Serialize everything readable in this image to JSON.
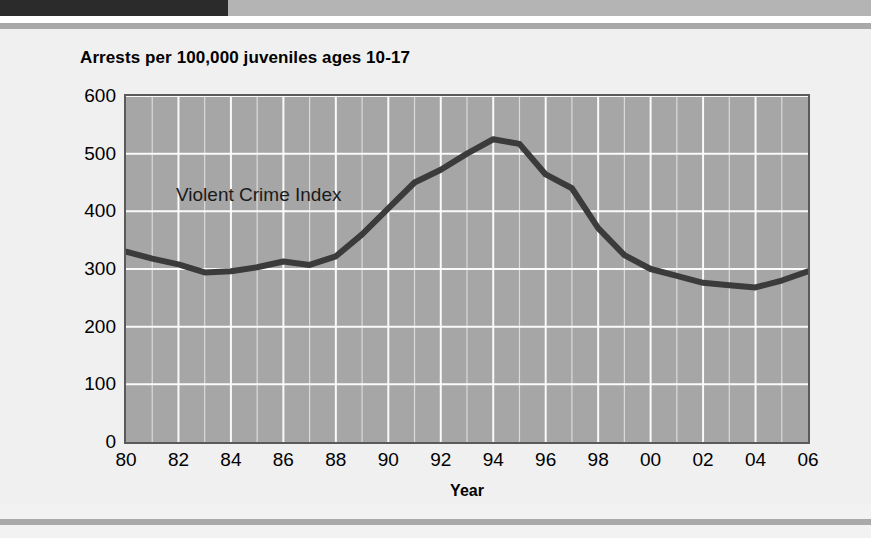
{
  "document": {
    "header_bar_dark_color": "#2b2b2b",
    "header_bar_gray_color": "#b4b4b4",
    "rule_color": "#a9a9a9",
    "panel_background": "#f0f0f0"
  },
  "chart_data": {
    "type": "line",
    "title": "Arrests per 100,000 juveniles ages 10-17",
    "subtitle": "",
    "xlabel": "Year",
    "ylabel": "",
    "xlim": [
      1980,
      2006
    ],
    "ylim": [
      0,
      600
    ],
    "grid": true,
    "grid_color": "#ffffff",
    "plot_background": "#a6a6a6",
    "line_color": "#3b3b3b",
    "legend_position": "inline-annotation",
    "annotations": [
      {
        "text": "Violent Crime Index",
        "x": 1982,
        "y": 420
      }
    ],
    "x_tick_labels": [
      "80",
      "82",
      "84",
      "86",
      "88",
      "90",
      "92",
      "94",
      "96",
      "98",
      "00",
      "02",
      "04",
      "06"
    ],
    "x_tick_values": [
      1980,
      1982,
      1984,
      1986,
      1988,
      1990,
      1992,
      1994,
      1996,
      1998,
      2000,
      2002,
      2004,
      2006
    ],
    "y_tick_labels": [
      "0",
      "100",
      "200",
      "300",
      "400",
      "500",
      "600"
    ],
    "y_tick_values": [
      0,
      100,
      200,
      300,
      400,
      500,
      600
    ],
    "categories": [
      1980,
      1981,
      1982,
      1983,
      1984,
      1985,
      1986,
      1987,
      1988,
      1989,
      1990,
      1991,
      1992,
      1993,
      1994,
      1995,
      1996,
      1997,
      1998,
      1999,
      2000,
      2001,
      2002,
      2003,
      2004,
      2005,
      2006
    ],
    "series": [
      {
        "name": "Violent Crime Index",
        "values": [
          330,
          318,
          308,
          294,
          296,
          303,
          313,
          307,
          322,
          360,
          405,
          450,
          472,
          500,
          525,
          517,
          464,
          440,
          371,
          324,
          300,
          288,
          276,
          272,
          268,
          280,
          296
        ]
      }
    ]
  }
}
